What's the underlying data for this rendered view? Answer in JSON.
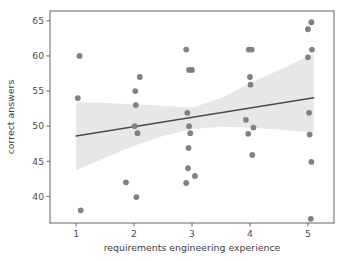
{
  "chart_data": {
    "type": "scatter",
    "title": "",
    "xlabel": "requirements engineering experience",
    "ylabel": "correct answers",
    "xlim": [
      0.55,
      5.45
    ],
    "ylim": [
      36.2,
      66.4
    ],
    "xticks": [
      1,
      2,
      3,
      4,
      5
    ],
    "xtick_labels": [
      "1",
      "2",
      "3",
      "4",
      "5"
    ],
    "yticks": [
      40,
      45,
      50,
      55,
      60,
      65
    ],
    "ytick_labels": [
      "40",
      "45",
      "50",
      "55",
      "60",
      "65"
    ],
    "grid": false,
    "legend": null,
    "point_color": "#80808a",
    "line_color": "#4a4a55",
    "band_color": "#d9d9d9",
    "points": [
      {
        "x": 1.06,
        "y": 60.0
      },
      {
        "x": 1.03,
        "y": 54.0
      },
      {
        "x": 1.08,
        "y": 38.0
      },
      {
        "x": 1.86,
        "y": 42.0
      },
      {
        "x": 2.02,
        "y": 55.0
      },
      {
        "x": 2.03,
        "y": 53.0
      },
      {
        "x": 2.01,
        "y": 50.0
      },
      {
        "x": 2.06,
        "y": 49.0
      },
      {
        "x": 2.1,
        "y": 57.0
      },
      {
        "x": 2.04,
        "y": 39.9
      },
      {
        "x": 2.9,
        "y": 60.9
      },
      {
        "x": 2.95,
        "y": 58.0
      },
      {
        "x": 3.0,
        "y": 58.0
      },
      {
        "x": 2.92,
        "y": 51.9
      },
      {
        "x": 2.95,
        "y": 50.0
      },
      {
        "x": 2.97,
        "y": 49.0
      },
      {
        "x": 2.94,
        "y": 46.9
      },
      {
        "x": 2.93,
        "y": 44.0
      },
      {
        "x": 2.9,
        "y": 41.9
      },
      {
        "x": 3.05,
        "y": 42.9
      },
      {
        "x": 3.98,
        "y": 60.9
      },
      {
        "x": 4.03,
        "y": 60.9
      },
      {
        "x": 4.0,
        "y": 57.0
      },
      {
        "x": 4.01,
        "y": 55.9
      },
      {
        "x": 3.93,
        "y": 50.9
      },
      {
        "x": 3.97,
        "y": 48.9
      },
      {
        "x": 4.06,
        "y": 49.8
      },
      {
        "x": 4.04,
        "y": 45.9
      },
      {
        "x": 5.06,
        "y": 64.8
      },
      {
        "x": 5.0,
        "y": 63.8
      },
      {
        "x": 5.07,
        "y": 60.9
      },
      {
        "x": 5.0,
        "y": 59.8
      },
      {
        "x": 5.02,
        "y": 51.9
      },
      {
        "x": 5.03,
        "y": 48.8
      },
      {
        "x": 5.06,
        "y": 44.9
      },
      {
        "x": 5.05,
        "y": 36.8
      }
    ],
    "regression": {
      "x_start": 1.0,
      "y_start": 48.6,
      "x_end": 5.1,
      "y_end": 54.05
    },
    "confidence_band": {
      "upper": [
        {
          "x": 1.0,
          "y": 53.4
        },
        {
          "x": 1.5,
          "y": 53.3
        },
        {
          "x": 2.0,
          "y": 53.1
        },
        {
          "x": 2.5,
          "y": 52.9
        },
        {
          "x": 3.0,
          "y": 52.6
        },
        {
          "x": 3.5,
          "y": 54.0
        },
        {
          "x": 4.0,
          "y": 56.1
        },
        {
          "x": 4.5,
          "y": 58.0
        },
        {
          "x": 5.1,
          "y": 60.3
        }
      ],
      "lower": [
        {
          "x": 1.0,
          "y": 43.7
        },
        {
          "x": 1.5,
          "y": 45.5
        },
        {
          "x": 2.0,
          "y": 47.2
        },
        {
          "x": 2.5,
          "y": 48.6
        },
        {
          "x": 3.0,
          "y": 49.6
        },
        {
          "x": 3.5,
          "y": 49.9
        },
        {
          "x": 4.0,
          "y": 49.8
        },
        {
          "x": 4.5,
          "y": 49.5
        },
        {
          "x": 5.1,
          "y": 49.1
        }
      ]
    }
  }
}
